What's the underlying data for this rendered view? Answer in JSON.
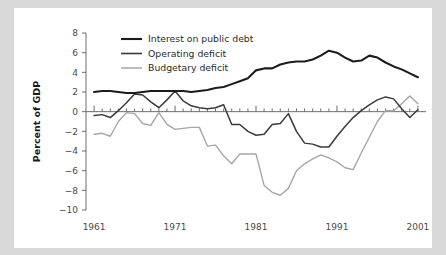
{
  "chart_data": {
    "type": "line",
    "title": "",
    "subtitle": "",
    "xlabel": "",
    "ylabel": "Percent of GDP",
    "xlim": [
      1960,
      2002
    ],
    "ylim": [
      -10,
      8
    ],
    "grid": false,
    "legend_position": "top-left-inside",
    "x_ticks": [
      1961,
      1971,
      1981,
      1991,
      2001
    ],
    "x_tick_labels": [
      "1961",
      "1971",
      "1981",
      "1991",
      "2001"
    ],
    "y_ticks": [
      8,
      6,
      4,
      2,
      0,
      -2,
      -4,
      -6,
      -8,
      -10
    ],
    "y_tick_labels": [
      "8",
      "6",
      "4",
      "2",
      "0",
      "−2",
      "−4",
      "−6",
      "−8",
      "−10"
    ],
    "zero_line": 0,
    "x": [
      1961,
      1962,
      1963,
      1964,
      1965,
      1966,
      1967,
      1968,
      1969,
      1970,
      1971,
      1972,
      1973,
      1974,
      1975,
      1976,
      1977,
      1978,
      1979,
      1980,
      1981,
      1982,
      1983,
      1984,
      1985,
      1986,
      1987,
      1988,
      1989,
      1990,
      1991,
      1992,
      1993,
      1994,
      1995,
      1996,
      1997,
      1998,
      1999,
      2000,
      2001
    ],
    "series": [
      {
        "name": "Interest on public debt",
        "color": "#1c1c1c",
        "values": [
          2.0,
          2.1,
          2.1,
          2.0,
          1.9,
          1.9,
          2.0,
          2.1,
          2.1,
          2.1,
          2.1,
          2.1,
          2.0,
          2.1,
          2.2,
          2.4,
          2.5,
          2.8,
          3.1,
          3.4,
          4.2,
          4.4,
          4.4,
          4.8,
          5.0,
          5.1,
          5.1,
          5.3,
          5.7,
          6.2,
          6.0,
          5.5,
          5.1,
          5.2,
          5.7,
          5.5,
          5.0,
          4.6,
          4.3,
          3.9,
          3.5
        ]
      },
      {
        "name": "Operating deficit",
        "color": "#3a3a3a",
        "values": [
          -0.4,
          -0.3,
          -0.6,
          0.1,
          0.9,
          1.8,
          1.7,
          1.0,
          0.4,
          1.2,
          2.1,
          1.1,
          0.6,
          0.4,
          0.3,
          0.4,
          0.7,
          -1.3,
          -1.3,
          -2.0,
          -2.4,
          -2.3,
          -1.3,
          -1.2,
          -0.2,
          -2.0,
          -3.2,
          -3.3,
          -3.6,
          -3.6,
          -2.5,
          -1.5,
          -0.6,
          0.1,
          0.7,
          1.2,
          1.5,
          1.3,
          0.3,
          -0.6,
          0.2
        ]
      },
      {
        "name": "Budgetary deficit",
        "color": "#a6a6a6",
        "values": [
          -2.3,
          -2.2,
          -2.5,
          -1.0,
          -0.1,
          -0.2,
          -1.2,
          -1.4,
          -0.1,
          -1.3,
          -1.8,
          -1.7,
          -1.6,
          -1.6,
          -3.5,
          -3.4,
          -4.5,
          -5.3,
          -4.3,
          -4.3,
          -4.3,
          -7.5,
          -8.2,
          -8.5,
          -7.8,
          -6.0,
          -5.3,
          -4.8,
          -4.4,
          -4.7,
          -5.1,
          -5.7,
          -5.9,
          -4.2,
          -2.6,
          -1.0,
          0.1,
          0.1,
          0.8,
          1.6,
          0.8
        ]
      }
    ],
    "colors": {
      "interest": "#1c1c1c",
      "operating": "#3a3a3a",
      "budgetary": "#a6a6a6",
      "axis": "#6d6d6d",
      "page_background": "#d9d9d9",
      "figure_background": "#ffffff"
    }
  },
  "legend": {
    "items": [
      {
        "label": "Interest on public debt"
      },
      {
        "label": "Operating deficit"
      },
      {
        "label": "Budgetary deficit"
      }
    ]
  }
}
